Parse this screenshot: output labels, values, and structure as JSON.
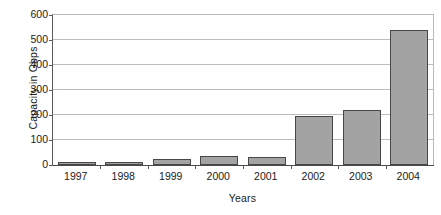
{
  "chart_data": {
    "type": "bar",
    "title": "",
    "xlabel": "Years",
    "ylabel": "Capacity in Gbps",
    "categories": [
      "1997",
      "1998",
      "1999",
      "2000",
      "2001",
      "2002",
      "2003",
      "2004"
    ],
    "values": [
      12,
      12,
      24,
      35,
      33,
      198,
      220,
      540
    ],
    "series": [
      {
        "name": "Capacity",
        "values": [
          12,
          12,
          24,
          35,
          33,
          198,
          220,
          540
        ]
      }
    ],
    "ylim": [
      0,
      600
    ],
    "y_ticks": [
      "600",
      "500",
      "400",
      "300",
      "200",
      "100",
      "0"
    ],
    "y_tick_values": [
      600,
      500,
      400,
      300,
      200,
      100,
      0
    ],
    "grid": true,
    "legend": false,
    "legend_position": "none",
    "colors": {
      "bar_fill": "#a3a3a3",
      "bar_border": "#474747",
      "gridline": "#bdbdbd",
      "axis": "#4a4a4a",
      "background": "#ffffff",
      "text": "#1a1a1a"
    }
  }
}
